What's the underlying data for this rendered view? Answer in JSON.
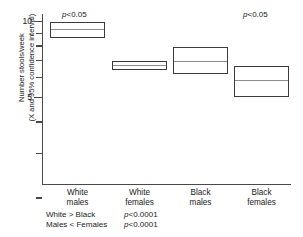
{
  "chart_data": {
    "type": "bar",
    "title": "",
    "subtitle": "",
    "xlabel": "",
    "ylabel": "Number stools/week (X and 95% confidence interval)",
    "ylabel_lines": [
      "Number stools/week",
      "(X and 95% confidence interval)"
    ],
    "yscale": "log",
    "ylim": [
      2.0,
      11.0
    ],
    "grid": false,
    "legend": null,
    "yticks_labeled": [
      {
        "value": 10,
        "label": "10"
      },
      {
        "value": 5,
        "label": "5"
      }
    ],
    "ytick_values_minor": [
      9,
      8,
      7,
      6,
      4,
      3,
      2
    ],
    "categories": [
      "White males",
      "White females",
      "Black males",
      "Black females"
    ],
    "category_lines": [
      [
        "White",
        "males"
      ],
      [
        "White",
        "females"
      ],
      [
        "Black",
        "males"
      ],
      [
        "Black",
        "females"
      ]
    ],
    "series": [
      {
        "name": "Mean number of stools per week",
        "values": [
          9.3,
          6.7,
          6.95,
          5.85
        ]
      },
      {
        "name": "95% confidence interval upper",
        "values": [
          9.95,
          6.95,
          7.9,
          6.65
        ]
      },
      {
        "name": "95% confidence interval lower",
        "values": [
          8.55,
          6.4,
          6.15,
          5.0
        ]
      }
    ],
    "annotations": [
      {
        "text": "p<0.05",
        "italic_prefix": "p",
        "rest": "<0.05",
        "target": "White males"
      },
      {
        "text": "p<0.05",
        "italic_prefix": "p",
        "rest": "<0.05",
        "target": "Black females"
      }
    ],
    "footnote_rows": [
      {
        "comparison": "White > Black",
        "italic_prefix": "p",
        "pvalue": "<0.0001"
      },
      {
        "comparison": "Males < Females",
        "italic_prefix": "p",
        "pvalue": "<0.0001"
      }
    ]
  },
  "colors": {
    "box_border": "#3a3a3a",
    "mean_line": "#8c8c8c",
    "axis": "#4a4a4a",
    "text": "#1a1a1a",
    "background": "#ffffff"
  }
}
